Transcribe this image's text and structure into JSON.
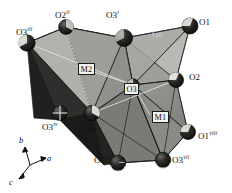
{
  "figure": {
    "type": "crystal-structure-polyhedra",
    "background_color": "#ffffff",
    "atom_labels": [
      {
        "id": "o2-ii",
        "base": "O2",
        "sup": "ii",
        "x": 55,
        "y": 14,
        "style": "plain"
      },
      {
        "id": "o3-i",
        "base": "O3",
        "sup": "i",
        "x": 105,
        "y": 14,
        "style": "plain"
      },
      {
        "id": "o1",
        "base": "O1",
        "sup": "",
        "x": 196,
        "y": 18,
        "style": "plain"
      },
      {
        "id": "o3-iii",
        "base": "O3",
        "sup": "iii",
        "x": 22,
        "y": 31,
        "style": "plain"
      },
      {
        "id": "ge",
        "base": "Ge",
        "sup": "",
        "x": 152,
        "y": 33,
        "style": "ghost"
      },
      {
        "id": "m2",
        "base": "M2",
        "sup": "",
        "x": 80,
        "y": 66,
        "style": "boxed"
      },
      {
        "id": "o2",
        "base": "O2",
        "sup": "",
        "x": 188,
        "y": 73,
        "style": "plain"
      },
      {
        "id": "o3",
        "base": "O3",
        "sup": "",
        "x": 124,
        "y": 83,
        "style": "boxed"
      },
      {
        "id": "m1",
        "base": "M1",
        "sup": "",
        "x": 152,
        "y": 112,
        "style": "boxed"
      },
      {
        "id": "o3-iv",
        "base": "O3",
        "sup": "iv",
        "x": 42,
        "y": 122,
        "style": "plain"
      },
      {
        "id": "o1-b",
        "base": "O1",
        "sup": "",
        "x": 84,
        "y": 123,
        "style": "plain"
      },
      {
        "id": "o1-viii",
        "base": "O1",
        "sup": "viii",
        "x": 196,
        "y": 132,
        "style": "plain"
      },
      {
        "id": "o2-vi",
        "base": "O2",
        "sup": "vi",
        "x": 98,
        "y": 155,
        "style": "plain"
      },
      {
        "id": "o3-vii",
        "base": "O3",
        "sup": "vii",
        "x": 169,
        "y": 155,
        "style": "plain"
      }
    ],
    "axis_triad": {
      "origin_x": 30,
      "origin_y": 165,
      "axes": [
        {
          "name": "b",
          "label": "b",
          "lx": 19,
          "ly": 138
        },
        {
          "name": "a",
          "label": "a",
          "lx": 48,
          "ly": 160
        },
        {
          "name": "c",
          "label": "c",
          "lx": 10,
          "ly": 182
        }
      ]
    },
    "colors": {
      "face_light": "#b4b4b0",
      "face_mid": "#8e8e8a",
      "face_dark": "#5c5c59",
      "face_darkest": "#343432",
      "edge": "#1c1c1c",
      "atom_fill": "#141414",
      "atom_highlight": "#f0f0ec",
      "bond_light": "#e6e6e0",
      "label_text": "#111111",
      "ghost_text": "#cfcfcc"
    }
  }
}
